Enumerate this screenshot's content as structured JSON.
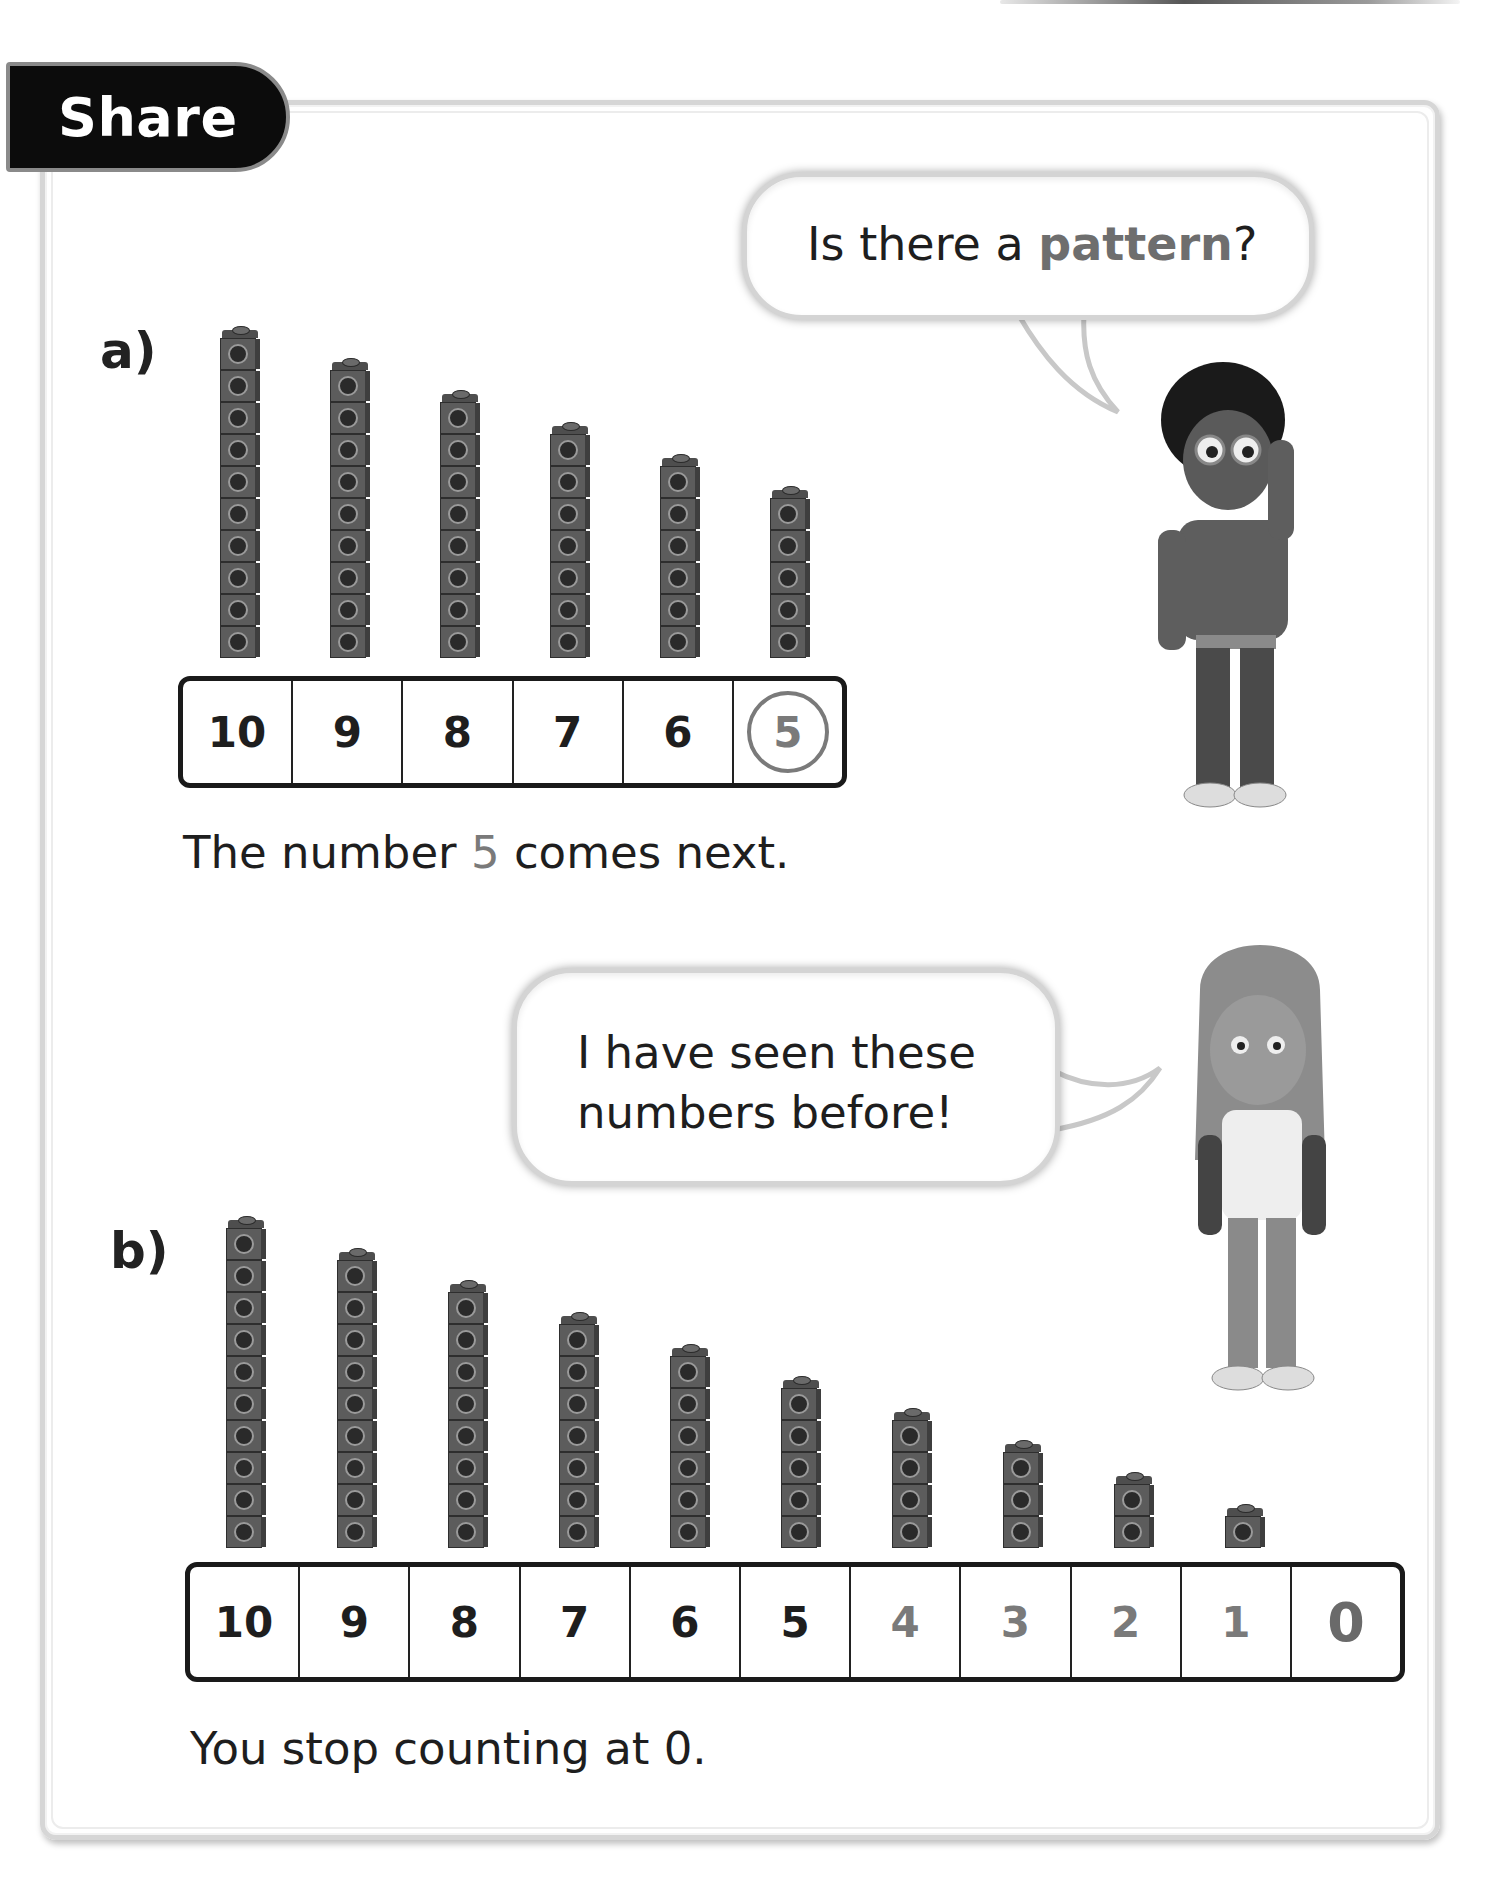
{
  "header": {
    "tab_label": "Share"
  },
  "section_a": {
    "label": "a)",
    "bubble": {
      "text_before": "Is there a ",
      "text_highlight": "pattern",
      "text_after": "?"
    },
    "stacks": [
      10,
      9,
      8,
      7,
      6,
      5
    ],
    "track": [
      {
        "value": "10",
        "style": "normal"
      },
      {
        "value": "9",
        "style": "normal"
      },
      {
        "value": "8",
        "style": "normal"
      },
      {
        "value": "7",
        "style": "normal"
      },
      {
        "value": "6",
        "style": "normal"
      },
      {
        "value": "5",
        "style": "circled"
      }
    ],
    "sentence": {
      "before": "The number ",
      "number": "5",
      "after": " comes next."
    },
    "character": "boy-with-glasses"
  },
  "section_b": {
    "label": "b)",
    "bubble": {
      "line1": "I have seen these",
      "line2": "numbers before!"
    },
    "stacks": [
      10,
      9,
      8,
      7,
      6,
      5,
      4,
      3,
      2,
      1
    ],
    "track": [
      {
        "value": "10",
        "style": "normal"
      },
      {
        "value": "9",
        "style": "normal"
      },
      {
        "value": "8",
        "style": "normal"
      },
      {
        "value": "7",
        "style": "normal"
      },
      {
        "value": "6",
        "style": "normal"
      },
      {
        "value": "5",
        "style": "normal"
      },
      {
        "value": "4",
        "style": "grey"
      },
      {
        "value": "3",
        "style": "grey"
      },
      {
        "value": "2",
        "style": "grey"
      },
      {
        "value": "1",
        "style": "grey"
      },
      {
        "value": "0",
        "style": "big"
      }
    ],
    "sentence": "You stop counting at 0.",
    "character": "girl-long-hair"
  },
  "colors": {
    "cube": "#5c5c5c",
    "highlight": "#7a7a7a",
    "tab_bg": "#0c0c0c"
  }
}
